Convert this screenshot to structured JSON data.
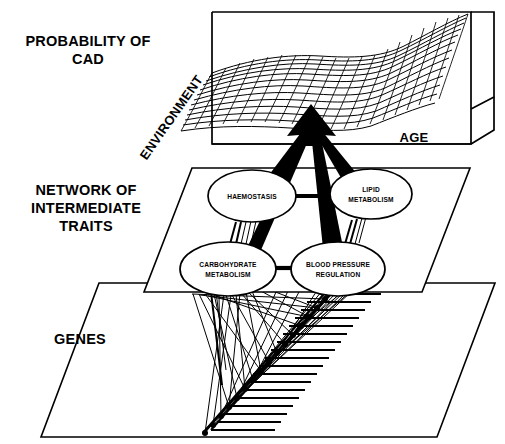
{
  "figure": {
    "background_color": "#ffffff",
    "ink_color": "#000000"
  },
  "tiers": [
    {
      "id": "probability",
      "label_lines": [
        "PROBABILITY OF",
        "CAD"
      ],
      "label_line_1": "PROBABILITY OF",
      "label_line_2": "CAD",
      "description": "3D response-surface mesh of CAD probability"
    },
    {
      "id": "network",
      "label_lines": [
        "NETWORK OF",
        "INTERMEDIATE",
        "TRAITS"
      ],
      "label_line_1": "NETWORK OF",
      "label_line_2": "INTERMEDIATE",
      "label_line_3": "TRAITS",
      "description": "Plane holding four intermediate trait nodes"
    },
    {
      "id": "genes",
      "label_lines": [
        "GENES"
      ],
      "label_line_1": "GENES",
      "description": "Plane holding the chromosome map of gene loci"
    }
  ],
  "surface": {
    "axis_depth_label": "ENVIRONMENT",
    "axis_horizontal_label": "AGE",
    "vertical_quantity": "PROBABILITY OF CAD",
    "mesh_rows": 13,
    "mesh_cols": 21,
    "shape_note": "saddle/valley surface rising steeply toward high AGE"
  },
  "traits": [
    {
      "id": "haemostasis",
      "label_line_1": "HAEMOSTASIS",
      "label_line_2": "",
      "cx": 252,
      "cy": 196,
      "rx": 44,
      "ry": 26
    },
    {
      "id": "lipid-metabolism",
      "label_line_1": "LIPID",
      "label_line_2": "METABOLISM",
      "cx": 371,
      "cy": 194,
      "rx": 41,
      "ry": 25
    },
    {
      "id": "carbohydrate-metabolism",
      "label_line_1": "CARBOHYDRATE",
      "label_line_2": "METABOLISM",
      "cx": 228,
      "cy": 269,
      "rx": 48,
      "ry": 27
    },
    {
      "id": "blood-pressure-regulation",
      "label_line_1": "BLOOD PRESSURE",
      "label_line_2": "REGULATION",
      "cx": 338,
      "cy": 269,
      "rx": 47,
      "ry": 27
    }
  ],
  "trait_links": [
    {
      "id": "haemostasis-to-lipid",
      "from": "haemostasis",
      "to": "lipid-metabolism"
    },
    {
      "id": "carbohydrate-to-blood-pressure",
      "from": "carbohydrate-metabolism",
      "to": "blood-pressure-regulation"
    },
    {
      "id": "haemostasis-to-carbohydrate",
      "from": "haemostasis",
      "to": "carbohydrate-metabolism"
    },
    {
      "id": "lipid-to-blood-pressure",
      "from": "lipid-metabolism",
      "to": "blood-pressure-regulation"
    }
  ],
  "arrows": {
    "count": 4,
    "target": "probability-surface",
    "sources": [
      "haemostasis",
      "lipid-metabolism",
      "carbohydrate-metabolism",
      "blood-pressure-regulation"
    ],
    "style": "solid black tapering arrows converging on a single arrowhead"
  },
  "genes": {
    "locus_count": 17,
    "chromosome_note": "diagonal chromosome ladder with marked gene loci",
    "link_note": "many thin lines run from gene loci up to the intermediate trait nodes"
  }
}
